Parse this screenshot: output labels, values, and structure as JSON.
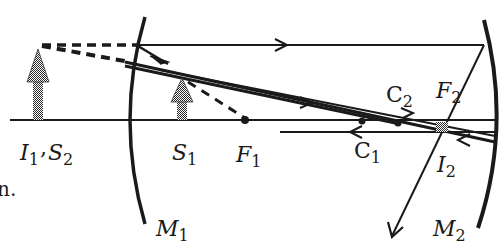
{
  "diagram": {
    "type": "optics-two-mirror-ray-diagram",
    "colors": {
      "ink": "#1a1a1a",
      "arrow_fill": "#555555",
      "background": "#ffffff"
    },
    "labels": {
      "i1": {
        "main": "I",
        "sub": "1"
      },
      "comma": ",",
      "s2": {
        "main": "S",
        "sub": "2"
      },
      "s1": {
        "main": "S",
        "sub": "1"
      },
      "f1": {
        "main": "F",
        "sub": "1"
      },
      "c1": {
        "main": "C",
        "sub": "1"
      },
      "c2": {
        "main": "C",
        "sub": "2"
      },
      "f2": {
        "main": "F",
        "sub": "2"
      },
      "i2": {
        "main": "I",
        "sub": "2"
      },
      "m1": {
        "main": "M",
        "sub": "1"
      },
      "m2": {
        "main": "M",
        "sub": "2"
      },
      "fragment": "n."
    },
    "elements": {
      "mirrors": [
        "M1 (left, concave toward right)",
        "M2 (right, concave toward left)"
      ],
      "objects": [
        "S1 arrow",
        "I1/S2 virtual image arrow"
      ],
      "points": [
        "F1",
        "C1",
        "C2",
        "F2",
        "I2"
      ]
    }
  }
}
